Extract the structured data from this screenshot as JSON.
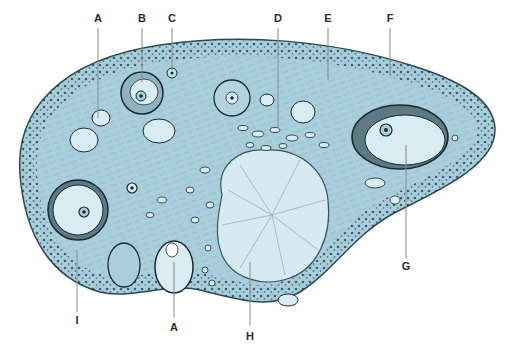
{
  "figure": {
    "colors": {
      "tissue": "#a9cfdc",
      "tissue_dark": "#7fb0c2",
      "cortex_dots": "#1f3a44",
      "follicle_fill": "#d8ecf2",
      "outline": "#1a2a30",
      "leader_line": "#8a8a8a",
      "label_text": "#2a2a2a"
    }
  },
  "labels": [
    {
      "id": "A_top",
      "text": "A",
      "x": 98,
      "y": 20
    },
    {
      "id": "B",
      "text": "B",
      "x": 142,
      "y": 20
    },
    {
      "id": "C",
      "text": "C",
      "x": 172,
      "y": 20
    },
    {
      "id": "D",
      "text": "D",
      "x": 278,
      "y": 20
    },
    {
      "id": "E",
      "text": "E",
      "x": 328,
      "y": 20
    },
    {
      "id": "F",
      "text": "F",
      "x": 390,
      "y": 20
    },
    {
      "id": "G",
      "text": "G",
      "x": 406,
      "y": 270
    },
    {
      "id": "I",
      "text": "I",
      "x": 77,
      "y": 322
    },
    {
      "id": "A_bottom",
      "text": "A",
      "x": 174,
      "y": 330
    },
    {
      "id": "H",
      "text": "H",
      "x": 250,
      "y": 339
    }
  ]
}
